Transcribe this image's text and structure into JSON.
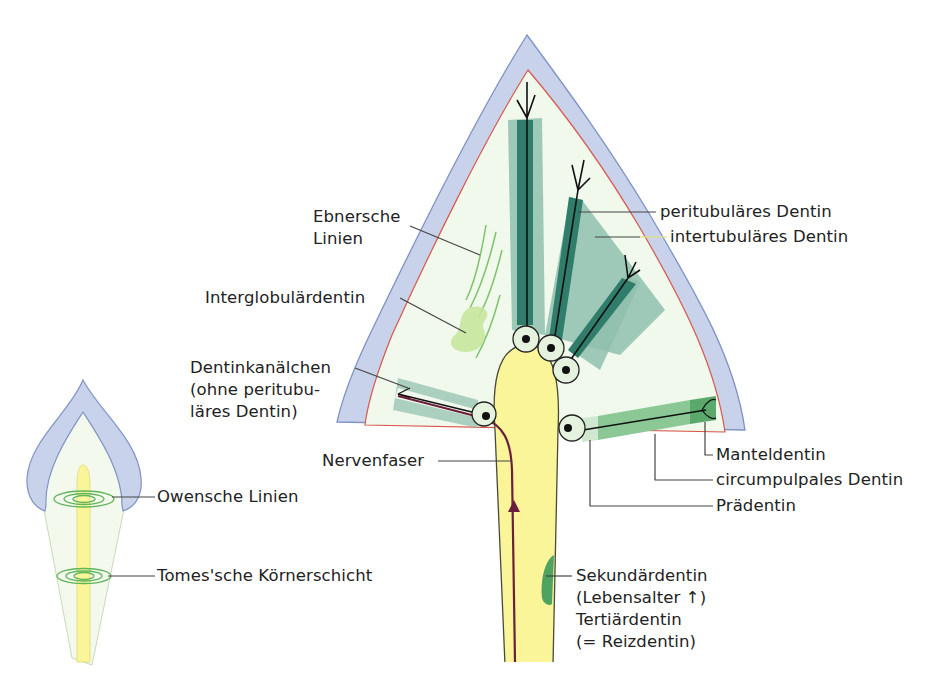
{
  "figure": {
    "colors": {
      "enamel": "#c8d2ea",
      "enamel_stroke": "#7f93c4",
      "dentin": "#f1f8ec",
      "dej_line": "#d9574a",
      "pulp": "#fbf59a",
      "pulp_stroke": "#4a4a3a",
      "tubule_dark": "#2f7d6a",
      "tubule_light": "#8fbfae",
      "mantle_dentin": "#5aa86b",
      "circumpulpal": "#8cc895",
      "predentin": "#cfe8cf",
      "odontoblast": "#e4f2de",
      "nerve": "#6b1f3c",
      "ebner_lines": "#7cc46a",
      "interglobular": "#c7e59d",
      "secondary_dentin": "#4ea361",
      "leader_line": "#444444"
    }
  },
  "labels": {
    "ebnersche": "Ebnersche\nLinien",
    "interglobular": "Interglobulärdentin",
    "dentinkanaelchen": "Dentinkanälchen\n(ohne peritubu-\nläres Dentin)",
    "nervenfaser": "Nervenfaser",
    "owensche": "Owensche Linien",
    "tomes": "Tomes'sche Körnerschicht",
    "peritubulaer": "peritubuläres Dentin",
    "intertubulaer": "intertubuläres Dentin",
    "manteldentin": "Manteldentin",
    "circumpulpal": "circumpulpales Dentin",
    "praedentin": "Prädentin",
    "sekundaer": "Sekundärdentin\n(Lebensalter ↑)\nTertiärdentin\n(= Reizdentin)"
  }
}
